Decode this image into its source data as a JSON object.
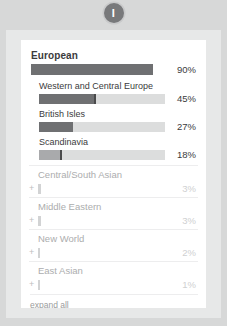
{
  "badge": {
    "label": "I",
    "icon": "info-badge-icon",
    "color": "#78797b"
  },
  "card": {
    "primary_group": {
      "title": "European",
      "percent": "90%",
      "value": 90,
      "bar_color": "#6f7072",
      "subregions": [
        {
          "title": "Western and Central Europe",
          "percent": "45%",
          "value": 45,
          "fill_style": "dark",
          "tick": true
        },
        {
          "title": "British Isles",
          "percent": "27%",
          "value": 27,
          "fill_style": "dark",
          "tick": false
        },
        {
          "title": "Scandinavia",
          "percent": "18%",
          "value": 18,
          "fill_style": "light",
          "tick": true
        }
      ]
    },
    "collapsed_groups": [
      {
        "title": "Central/South Asian",
        "percent": "3%",
        "value": 3,
        "expand_icon": "plus-icon"
      },
      {
        "title": "Middle Eastern",
        "percent": "3%",
        "value": 3,
        "expand_icon": "plus-icon"
      },
      {
        "title": "New World",
        "percent": "2%",
        "value": 2,
        "expand_icon": "plus-icon"
      },
      {
        "title": "East Asian",
        "percent": "1%",
        "value": 1,
        "expand_icon": "plus-icon"
      }
    ],
    "footer": {
      "expand_all_label": "expand all"
    }
  },
  "chart_data": {
    "type": "bar",
    "title": "European",
    "categories": [
      "European",
      "Western and Central Europe",
      "British Isles",
      "Scandinavia",
      "Central/South Asian",
      "Middle Eastern",
      "New World",
      "East Asian"
    ],
    "values": [
      90,
      45,
      27,
      18,
      3,
      3,
      2,
      1
    ],
    "xlabel": "",
    "ylabel": "",
    "ylim": [
      0,
      100
    ],
    "grid": false,
    "legend": "none"
  }
}
